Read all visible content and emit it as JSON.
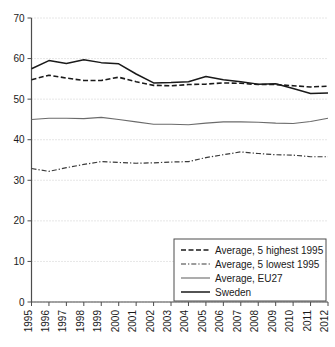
{
  "chart_data": {
    "type": "line",
    "title": "",
    "xlabel": "",
    "ylabel": "",
    "xlim": [
      1995,
      2012
    ],
    "ylim": [
      0,
      70
    ],
    "ytick_step": 10,
    "grid": true,
    "legend_position": "bottom-right",
    "x": [
      1995,
      1996,
      1997,
      1998,
      1999,
      2000,
      2001,
      2002,
      2003,
      2004,
      2005,
      2006,
      2007,
      2008,
      2009,
      2010,
      2011,
      2012
    ],
    "xtick_labels": [
      "1995",
      "1996",
      "1997",
      "1998",
      "1999",
      "2000",
      "2001",
      "2002",
      "2003",
      "2004",
      "2005",
      "2006",
      "2007",
      "2008",
      "2009",
      "2010",
      "2011",
      "2012"
    ],
    "ytick_labels": [
      "0",
      "10",
      "20",
      "30",
      "40",
      "50",
      "60",
      "70"
    ],
    "ytick_values": [
      0,
      10,
      20,
      30,
      40,
      50,
      60,
      70
    ],
    "series": [
      {
        "name": "Average, 5 highest 1995",
        "style": "dashed",
        "color": "#1a1a1a",
        "width": 1.6,
        "values": [
          54.8,
          55.9,
          55.2,
          54.6,
          54.6,
          55.4,
          54.3,
          53.4,
          53.3,
          53.6,
          53.7,
          54.0,
          53.9,
          53.6,
          53.6,
          53.3,
          53.0,
          53.2
        ]
      },
      {
        "name": "Average, 5 lowest 1995",
        "style": "dash-dot",
        "color": "#3a3a3a",
        "width": 1.2,
        "values": [
          32.9,
          32.2,
          33.1,
          33.9,
          34.6,
          34.4,
          34.2,
          34.3,
          34.5,
          34.6,
          35.6,
          36.3,
          37.0,
          36.6,
          36.3,
          36.2,
          35.8,
          35.8
        ]
      },
      {
        "name": "Average, EU27",
        "style": "solid-thin",
        "color": "#6b6b6b",
        "width": 1.1,
        "values": [
          45.0,
          45.3,
          45.3,
          45.2,
          45.5,
          45.0,
          44.4,
          43.8,
          43.8,
          43.7,
          44.1,
          44.4,
          44.4,
          44.3,
          44.1,
          44.0,
          44.5,
          45.3
        ]
      },
      {
        "name": "Sweden",
        "style": "solid",
        "color": "#1a1a1a",
        "width": 1.5,
        "values": [
          57.5,
          59.5,
          58.8,
          59.7,
          59.0,
          58.7,
          56.2,
          54.0,
          54.1,
          54.3,
          55.6,
          54.8,
          54.3,
          53.7,
          53.8,
          52.6,
          51.4,
          51.5
        ]
      }
    ],
    "legend_entries": [
      {
        "label": "Average, 5 highest 1995",
        "style": "dashed"
      },
      {
        "label": "Average, 5 lowest 1995",
        "style": "dash-dot"
      },
      {
        "label": "Average, EU27",
        "style": "solid-thin"
      },
      {
        "label": "Sweden",
        "style": "solid"
      }
    ]
  }
}
